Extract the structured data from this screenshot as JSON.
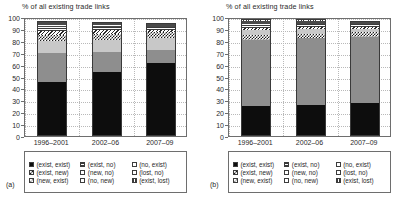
{
  "panels": [
    {
      "letter": "(a)",
      "title": "% of all existing trade links",
      "ylabel": "% of all existing trade links"
    },
    {
      "letter": "(b)",
      "title": "% of all existing trade links",
      "ylabel": "% of all existing trade links"
    }
  ],
  "axis": {
    "yticks": [
      "0",
      "10",
      "20",
      "30",
      "40",
      "50",
      "60",
      "70",
      "80",
      "90",
      "100"
    ],
    "xticks": [
      "1996–2001",
      "2002–06",
      "2007–09"
    ]
  },
  "legend": {
    "items": [
      {
        "label": "(exist, exist)",
        "swatch": "solid-black"
      },
      {
        "label": "(exist, no)",
        "swatch": "horizontal-lines"
      },
      {
        "label": "(no, exist)",
        "swatch": "white"
      },
      {
        "label": "(exist, new)",
        "swatch": "checker-dark"
      },
      {
        "label": "(new, no)",
        "swatch": "white"
      },
      {
        "label": "(lost, no)",
        "swatch": "white"
      },
      {
        "label": "(new, exist)",
        "swatch": "checker-light"
      },
      {
        "label": "(no, new)",
        "swatch": "white"
      },
      {
        "label": "(exist, lost)",
        "swatch": "vertical-lines"
      }
    ]
  },
  "chart_data": [
    {
      "type": "bar",
      "stacked": true,
      "panel": "(a)",
      "title": "% of all existing trade links",
      "xlabel": "",
      "ylabel": "% of all existing trade links",
      "ylim": [
        0,
        100
      ],
      "ytick_step": 10,
      "grid": "dotted",
      "legend_position": "below",
      "categories": [
        "1996–2001",
        "2002–06",
        "2007–09"
      ],
      "series": [
        {
          "name": "(exist, exist)",
          "fill": "solid-black",
          "values": [
            45,
            54,
            61
          ]
        },
        {
          "name": "(exist, new)",
          "fill": "solid-gray",
          "values": [
            25,
            17,
            11
          ]
        },
        {
          "name": "(new, exist)",
          "fill": "solid-lightgray",
          "values": [
            10,
            10,
            10
          ]
        },
        {
          "name": "(exist, no)",
          "fill": "checker-dark",
          "values": [
            5,
            5,
            5
          ]
        },
        {
          "name": "(new, no)",
          "fill": "hatch",
          "values": [
            3,
            3,
            3
          ]
        },
        {
          "name": "(no, new)",
          "fill": "horizontal-lines",
          "values": [
            4,
            4,
            4
          ]
        },
        {
          "name": "(no, exist)",
          "fill": "white",
          "values": [
            2,
            2,
            2
          ]
        },
        {
          "name": "(lost, no)",
          "fill": "white",
          "values": [
            2,
            2,
            1
          ]
        },
        {
          "name": "(exist, lost)",
          "fill": "vertical-lines",
          "values": [
            1,
            1,
            1
          ]
        }
      ],
      "segment_tops": [
        [
          45,
          70,
          80,
          85,
          88,
          92,
          94,
          96,
          97
        ],
        [
          54,
          71,
          81,
          86,
          89,
          92,
          94,
          95,
          96
        ],
        [
          61,
          72,
          82,
          87,
          89,
          92,
          93,
          94,
          95
        ]
      ]
    },
    {
      "type": "bar",
      "stacked": true,
      "panel": "(b)",
      "title": "% of all existing trade links",
      "xlabel": "",
      "ylabel": "% of all existing trade links",
      "ylim": [
        0,
        100
      ],
      "ytick_step": 10,
      "grid": "dotted",
      "legend_position": "below",
      "categories": [
        "1996–2001",
        "2002–06",
        "2007–09"
      ],
      "series": [
        {
          "name": "(exist, exist)",
          "fill": "solid-black",
          "values": [
            25,
            26,
            28
          ]
        },
        {
          "name": "(exist, new)",
          "fill": "solid-gray",
          "values": [
            56,
            56,
            55
          ]
        },
        {
          "name": "(new, exist)",
          "fill": "checker-dark",
          "values": [
            4,
            4,
            4
          ]
        },
        {
          "name": "(exist, no)",
          "fill": "solid-lightgray",
          "values": [
            4,
            4,
            3
          ]
        },
        {
          "name": "(new, no)",
          "fill": "hatch",
          "values": [
            2,
            2,
            2
          ]
        },
        {
          "name": "(no, new)",
          "fill": "horizontal-lines",
          "values": [
            4,
            4,
            4
          ]
        },
        {
          "name": "(no, exist)",
          "fill": "white",
          "values": [
            1,
            1,
            1
          ]
        },
        {
          "name": "(lost, no)",
          "fill": "white",
          "values": [
            1,
            1,
            1
          ]
        },
        {
          "name": "(exist, lost)",
          "fill": "vertical-lines",
          "values": [
            1,
            1,
            1
          ]
        }
      ],
      "segment_tops": [
        [
          25,
          81,
          85,
          89,
          91,
          95,
          96,
          97,
          98
        ],
        [
          26,
          82,
          86,
          90,
          92,
          95,
          96,
          97,
          98
        ],
        [
          28,
          83,
          87,
          90,
          92,
          95,
          96,
          97,
          97
        ]
      ]
    }
  ]
}
